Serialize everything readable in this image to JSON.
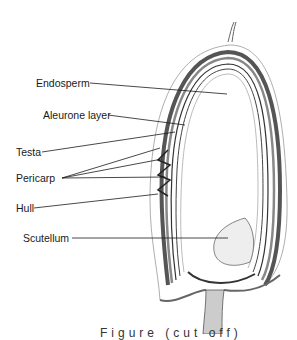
{
  "diagram": {
    "labels": [
      {
        "id": "endosperm",
        "text": "Endosperm"
      },
      {
        "id": "aleurone",
        "text": "Aleurone layer"
      },
      {
        "id": "testa",
        "text": "Testa"
      },
      {
        "id": "pericarp",
        "text": "Pericarp"
      },
      {
        "id": "hull",
        "text": "Hull"
      },
      {
        "id": "scutellum",
        "text": "Scutellum"
      }
    ],
    "caption": "Figure (cut off)",
    "colors": {
      "line": "#1a1a1a",
      "shading": "#777777",
      "background": "#ffffff"
    }
  }
}
